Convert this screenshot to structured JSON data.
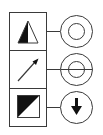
{
  "diagram": {
    "title": "",
    "colors": {
      "stroke": "#3a3a3a",
      "fill": "#111111",
      "background": "#ffffff"
    },
    "rows": [
      {
        "symbol": "half-filled-triangle-icon",
        "connector": "line",
        "terminal": "concentric-circles-icon"
      },
      {
        "symbol": "diagonal-arrow-icon",
        "connector": "line",
        "terminal": "concentric-circles-crosshair-icon"
      },
      {
        "symbol": "diagonal-half-filled-square-icon",
        "connector": "line",
        "terminal": "circle-down-arrow-icon"
      }
    ]
  }
}
